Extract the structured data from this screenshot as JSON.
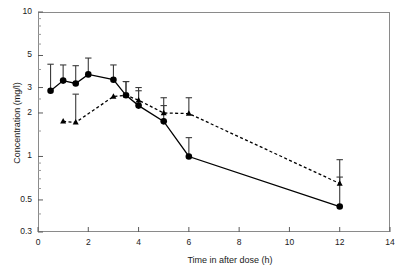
{
  "chart_data": {
    "type": "line",
    "title": "",
    "xlabel": "Time in after dose (h)",
    "ylabel": "Concentration (mg/l)",
    "xlim": [
      0,
      14
    ],
    "ylim": [
      0.3,
      10
    ],
    "yscale": "log",
    "grid": false,
    "legend": "none",
    "xticks": [
      0,
      2,
      4,
      6,
      8,
      10,
      12,
      14
    ],
    "xticklabels": [
      "0",
      "2",
      "4",
      "6",
      "8",
      "10",
      "12",
      "14"
    ],
    "yticks": [
      0.3,
      0.5,
      1,
      2,
      3,
      5,
      10
    ],
    "yticklabels": [
      "0.3",
      "0.5",
      "1",
      "2",
      "3",
      "5",
      "10"
    ],
    "series": [
      {
        "name": "circle-series",
        "marker": "circle",
        "linestyle": "solid",
        "color": "#000000",
        "points": [
          {
            "x": 0.5,
            "y": 2.85,
            "err_low": 2.85,
            "err_high": 4.35
          },
          {
            "x": 1.0,
            "y": 3.35,
            "err_low": 3.35,
            "err_high": 4.3
          },
          {
            "x": 1.5,
            "y": 3.2,
            "err_low": 3.2,
            "err_high": 4.25
          },
          {
            "x": 2.0,
            "y": 3.7,
            "err_low": 3.7,
            "err_high": 4.8
          },
          {
            "x": 3.0,
            "y": 3.4,
            "err_low": 3.4,
            "err_high": 4.3
          },
          {
            "x": 3.5,
            "y": 2.65,
            "err_low": 2.65,
            "err_high": 3.3
          },
          {
            "x": 4.0,
            "y": 2.25,
            "err_low": 2.25,
            "err_high": 2.85
          },
          {
            "x": 5.0,
            "y": 1.75,
            "err_low": 1.75,
            "err_high": 2.25
          },
          {
            "x": 6.0,
            "y": 1.0,
            "err_low": 1.0,
            "err_high": 1.35
          },
          {
            "x": 12.0,
            "y": 0.45,
            "err_low": 0.45,
            "err_high": 0.72
          }
        ]
      },
      {
        "name": "triangle-series",
        "marker": "triangle",
        "linestyle": "dashed",
        "color": "#000000",
        "points": [
          {
            "x": 1.0,
            "y": 1.75,
            "err_low": 1.75,
            "err_high": 1.75
          },
          {
            "x": 1.5,
            "y": 1.72,
            "err_low": 1.72,
            "err_high": 2.7
          },
          {
            "x": 3.0,
            "y": 2.6,
            "err_low": 2.6,
            "err_high": 2.6
          },
          {
            "x": 3.5,
            "y": 2.65,
            "err_low": 2.65,
            "err_high": 3.3
          },
          {
            "x": 4.0,
            "y": 2.45,
            "err_low": 2.45,
            "err_high": 3.0
          },
          {
            "x": 5.0,
            "y": 2.0,
            "err_low": 2.0,
            "err_high": 2.55
          },
          {
            "x": 6.0,
            "y": 1.98,
            "err_low": 1.98,
            "err_high": 2.55
          },
          {
            "x": 12.0,
            "y": 0.65,
            "err_low": 0.65,
            "err_high": 0.95
          }
        ]
      }
    ]
  }
}
